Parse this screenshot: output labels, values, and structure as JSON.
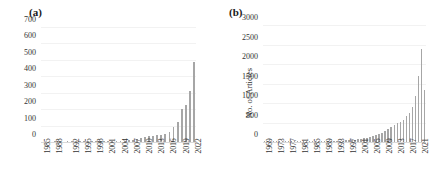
{
  "figure": {
    "background": "#ffffff",
    "bar_color": "#a6a6a6",
    "gridline_color": "#f2f2f2"
  },
  "panels": [
    {
      "id": "a",
      "label": "(a)",
      "ylabel": "",
      "chart_data": {
        "type": "bar",
        "title": "",
        "xlabel": "",
        "ylabel": "",
        "ylim": [
          0,
          700
        ],
        "yticks": [
          0,
          100,
          200,
          300,
          400,
          500,
          600,
          700
        ],
        "ytick_labels": [
          "0",
          "100",
          "200",
          "300",
          "400",
          "500",
          "600",
          "700"
        ],
        "grid": true,
        "legend": "none",
        "xtick_labels": [
          "1985",
          "1988",
          "1992",
          "1995",
          "1998",
          "2001",
          "2004",
          "2007",
          "2010",
          "2013",
          "2016",
          "2019",
          "2022"
        ],
        "categories": [
          "1985",
          "1986",
          "1987",
          "1988",
          "1989",
          "1990",
          "1991",
          "1992",
          "1993",
          "1994",
          "1995",
          "1996",
          "1997",
          "1998",
          "1999",
          "2000",
          "2001",
          "2002",
          "2003",
          "2004",
          "2005",
          "2006",
          "2007",
          "2008",
          "2009",
          "2010",
          "2011",
          "2012",
          "2013",
          "2014",
          "2015",
          "2016",
          "2017",
          "2018",
          "2019",
          "2020",
          "2021",
          "2022"
        ],
        "values": [
          0,
          0,
          0,
          1,
          0,
          0,
          1,
          2,
          1,
          2,
          1,
          2,
          2,
          3,
          2,
          3,
          3,
          4,
          4,
          6,
          8,
          10,
          14,
          20,
          26,
          32,
          38,
          40,
          44,
          46,
          48,
          62,
          92,
          120,
          205,
          230,
          315,
          490,
          620,
          360
        ]
      }
    },
    {
      "id": "b",
      "label": "(b)",
      "ylabel": "No. of Articles",
      "chart_data": {
        "type": "bar",
        "title": "",
        "xlabel": "",
        "ylabel": "No. of Articles",
        "ylim": [
          0,
          3000
        ],
        "yticks": [
          0,
          500,
          1000,
          1500,
          2000,
          2500,
          3000
        ],
        "ytick_labels": [
          "0",
          "500",
          "1000",
          "1500",
          "2000",
          "2500",
          "3000"
        ],
        "grid": true,
        "legend": "none",
        "xtick_labels": [
          "1969",
          "1973",
          "1977",
          "1981",
          "1985",
          "1989",
          "1993",
          "1997",
          "2001",
          "2005",
          "2009",
          "2013",
          "2017",
          "2021"
        ],
        "categories": [
          "1969",
          "1970",
          "1971",
          "1972",
          "1973",
          "1974",
          "1975",
          "1976",
          "1977",
          "1978",
          "1979",
          "1980",
          "1981",
          "1982",
          "1983",
          "1984",
          "1985",
          "1986",
          "1987",
          "1988",
          "1989",
          "1990",
          "1991",
          "1992",
          "1993",
          "1994",
          "1995",
          "1996",
          "1997",
          "1998",
          "1999",
          "2000",
          "2001",
          "2002",
          "2003",
          "2004",
          "2005",
          "2006",
          "2007",
          "2008",
          "2009",
          "2010",
          "2011",
          "2012",
          "2013",
          "2014",
          "2015",
          "2016",
          "2017",
          "2018",
          "2019",
          "2020",
          "2021",
          "2022"
        ],
        "values": [
          2,
          1,
          1,
          2,
          1,
          2,
          1,
          2,
          2,
          3,
          2,
          3,
          4,
          3,
          5,
          4,
          8,
          10,
          12,
          15,
          18,
          20,
          22,
          26,
          30,
          34,
          38,
          42,
          48,
          55,
          62,
          70,
          80,
          95,
          110,
          130,
          150,
          175,
          200,
          240,
          290,
          340,
          400,
          440,
          480,
          530,
          580,
          660,
          760,
          900,
          1180,
          1700,
          2400,
          1350
        ]
      }
    }
  ]
}
